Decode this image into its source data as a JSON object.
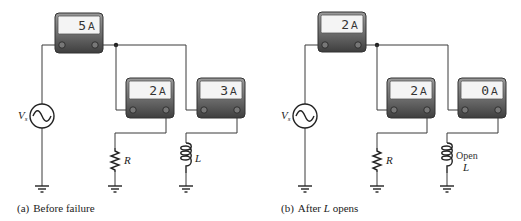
{
  "figure": {
    "panels": [
      {
        "id": "a",
        "caption_prefix": "(a)",
        "caption": "Before failure",
        "source_label": "V",
        "source_sub": "s",
        "meters": [
          {
            "name": "total",
            "value": "5",
            "unit": "A"
          },
          {
            "name": "resistor-branch",
            "value": "2",
            "unit": "A"
          },
          {
            "name": "inductor-branch",
            "value": "3",
            "unit": "A"
          }
        ],
        "resistor_label": "R",
        "inductor_label": "L",
        "inductor_note": ""
      },
      {
        "id": "b",
        "caption_prefix": "(b)",
        "caption_pre": "After ",
        "caption_italic": "L",
        "caption_post": " opens",
        "source_label": "V",
        "source_sub": "s",
        "meters": [
          {
            "name": "total",
            "value": "2",
            "unit": "A"
          },
          {
            "name": "resistor-branch",
            "value": "2",
            "unit": "A"
          },
          {
            "name": "inductor-branch",
            "value": "0",
            "unit": "A"
          }
        ],
        "resistor_label": "R",
        "inductor_label": "L",
        "inductor_note": "Open"
      }
    ],
    "colors": {
      "meter_body_top": "#8a8a8a",
      "meter_body_bottom": "#4a4a4a",
      "meter_display": "#f4f4f4",
      "wire": "#3a3a3a"
    }
  }
}
